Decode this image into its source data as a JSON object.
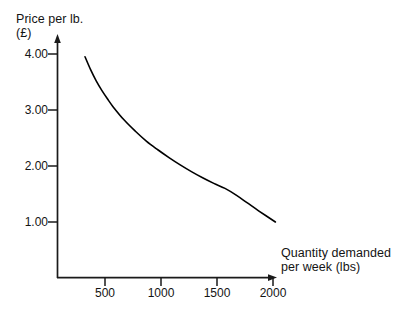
{
  "chart_data": {
    "type": "line",
    "title": "",
    "subtitle": "",
    "xlabel": "Quantity demanded\nper week (lbs)",
    "ylabel": "Price per lb.\n(£)",
    "ylabel_line1": "Price per lb.",
    "ylabel_line2": "(£)",
    "xlabel_line1": "Quantity demanded",
    "xlabel_line2": "per week (lbs)",
    "currency_symbol": "£",
    "xlim": [
      0,
      2050
    ],
    "ylim": [
      0,
      4.3
    ],
    "xticks": [
      500,
      1000,
      1500,
      2000
    ],
    "xtick_labels": [
      "500",
      "1000",
      "1500",
      "2000"
    ],
    "yticks": [
      1.0,
      2.0,
      3.0,
      4.0
    ],
    "ytick_labels": [
      "1.00",
      "2.00",
      "3.00",
      "4.00"
    ],
    "grid": false,
    "legend": false,
    "legend_position": "none",
    "series": [
      {
        "name": "Demand curve",
        "x": [
          250,
          300,
          350,
          400,
          450,
          500,
          600,
          700,
          800,
          900,
          1000,
          1100,
          1200,
          1300,
          1400,
          1500,
          1600,
          1700,
          1800,
          1950
        ],
        "y": [
          3.95,
          3.72,
          3.52,
          3.35,
          3.2,
          3.06,
          2.82,
          2.62,
          2.44,
          2.29,
          2.15,
          2.02,
          1.9,
          1.79,
          1.69,
          1.6,
          1.48,
          1.34,
          1.2,
          1.0
        ],
        "color": "#000000",
        "style": "solid",
        "width": 1.6
      }
    ],
    "annotations": [],
    "axis_arrows": {
      "x": true,
      "y": true
    },
    "axis_color": "#1a1a1a",
    "background_color": "#ffffff"
  },
  "geometry": {
    "origin_x": 57,
    "origin_y": 278,
    "x_axis_end": 276,
    "y_axis_end": 36,
    "px_per_500_lbs": 56,
    "px_per_pound": 56
  }
}
